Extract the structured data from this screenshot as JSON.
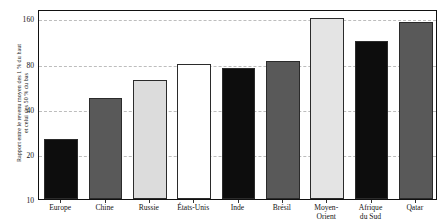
{
  "chart_data": {
    "type": "bar",
    "title": "",
    "subtitle": "",
    "xlabel": "",
    "ylabel": "Rapport entre le revenu moyen des 1 % du haut\net celui des 50 % du bas",
    "categories": [
      "Europe",
      "Chine",
      "Russie",
      "États-Unis",
      "Inde",
      "Brésil",
      "Moyen-\nOrient",
      "Afrique\ndu Sud",
      "Qatar"
    ],
    "values": [
      25,
      47,
      62,
      80,
      75,
      83,
      160,
      113,
      152
    ],
    "bar_colors": [
      "#0d0d0d",
      "#595959",
      "#dcdcdc",
      "#ffffff",
      "#0d0d0d",
      "#595959",
      "#e4e4e4",
      "#0d0d0d",
      "#595959"
    ],
    "bar_edge_color": "#2b2b2b",
    "yscale": "log",
    "ylim": [
      10,
      185
    ],
    "yticks": [
      10,
      20,
      40,
      80,
      160
    ],
    "ytick_labels": [
      "10",
      "20",
      "40",
      "80",
      "160"
    ],
    "gridlines": [
      20,
      40,
      80,
      160
    ],
    "grid": true,
    "grid_color": "#bdbdbd",
    "grid_style": "dashed",
    "legend": "none",
    "frame_color": "#111111",
    "background": "#ffffff"
  }
}
